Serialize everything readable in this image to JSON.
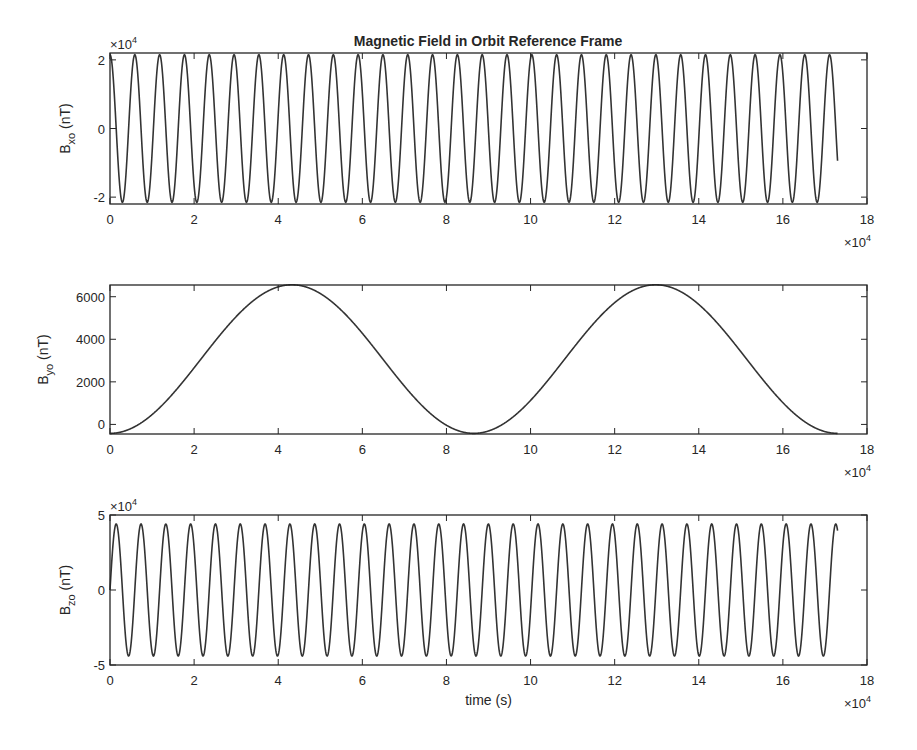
{
  "figure": {
    "title": "Magnetic Field in Orbit Reference Frame",
    "x_exponent_label": "×10",
    "x_exponent": "4",
    "line_color": "#333333",
    "axis_color": "#262626"
  },
  "chart_data": [
    {
      "type": "line",
      "title": "Magnetic Field in Orbit Reference Frame",
      "xlabel": "",
      "ylabel": "B_xo (nT)",
      "ylabel_main": "B",
      "ylabel_sub": "xo",
      "ylabel_unit": " (nT)",
      "x_multiplier": "×10^4",
      "y_multiplier": "×10^4",
      "xlim": [
        0,
        18
      ],
      "ylim": [
        -2.2,
        2.2
      ],
      "xticks": [
        "0",
        "2",
        "4",
        "6",
        "8",
        "10",
        "12",
        "14",
        "16",
        "18"
      ],
      "yticks": [
        {
          "v": 2,
          "label": "2"
        },
        {
          "v": 0,
          "label": "0"
        },
        {
          "v": -2,
          "label": "-2"
        }
      ],
      "grid": false,
      "series": [
        {
          "name": "Bxo",
          "form": "cos",
          "amplitude": 2.15,
          "offset": 0,
          "period": 0.59,
          "phase": 0,
          "x_end": 17.3
        }
      ]
    },
    {
      "type": "line",
      "title": "",
      "xlabel": "",
      "ylabel": "B_yo (nT)",
      "ylabel_main": "B",
      "ylabel_sub": "yo",
      "ylabel_unit": " (nT)",
      "x_multiplier": "×10^4",
      "y_multiplier": "",
      "xlim": [
        0,
        18
      ],
      "ylim": [
        -450,
        6550
      ],
      "xticks": [
        "0",
        "2",
        "4",
        "6",
        "8",
        "10",
        "12",
        "14",
        "16",
        "18"
      ],
      "yticks": [
        {
          "v": 6000,
          "label": "6000"
        },
        {
          "v": 4000,
          "label": "4000"
        },
        {
          "v": 2000,
          "label": "2000"
        },
        {
          "v": 0,
          "label": "0"
        }
      ],
      "grid": false,
      "series": [
        {
          "name": "Byo",
          "form": "one_minus_cos",
          "min": -420,
          "max": 6560,
          "period": 8.65,
          "phase": 0,
          "x_end": 17.3
        }
      ]
    },
    {
      "type": "line",
      "title": "",
      "xlabel": "time (s)",
      "ylabel": "B_zo (nT)",
      "ylabel_main": "B",
      "ylabel_sub": "zo",
      "ylabel_unit": " (nT)",
      "x_multiplier": "×10^4",
      "y_multiplier": "×10^4",
      "xlim": [
        0,
        18
      ],
      "ylim": [
        -5,
        5
      ],
      "xticks": [
        "0",
        "2",
        "4",
        "6",
        "8",
        "10",
        "12",
        "14",
        "16",
        "18"
      ],
      "yticks": [
        {
          "v": 5,
          "label": "5"
        },
        {
          "v": 0,
          "label": "0"
        },
        {
          "v": -5,
          "label": "-5"
        }
      ],
      "grid": false,
      "series": [
        {
          "name": "Bzo",
          "form": "sin",
          "amplitude": 4.4,
          "offset": 0,
          "period": 0.59,
          "phase": 0,
          "x_end": 17.3
        }
      ]
    }
  ]
}
